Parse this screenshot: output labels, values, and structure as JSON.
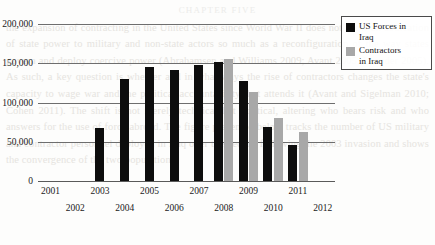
{
  "background_text": {
    "header": "CHAPTER FIVE",
    "paragraphs": [
      "the expansion of contracting in the United States since World War II",
      "does not show an abdication of state power to military and non-state",
      "actors so much as a reconfiguration of the way states govern and",
      "deploy coercive power (Abrahamsen and Williams 2009; Avant 2005;",
      "Leander 2005). As such, a key question is whether and in what ways",
      "the rise of contractors changes the state's capacity to wage war and",
      "the political accountability that attends it (Avant and Sigelman 2010;",
      "Cohen 2011). The shift is not merely technical but political, altering",
      "who bears risk and who answers for the use of force abroad.",
      "The figure presented below tracks the number of US military and",
      "contractor personnel deployed in Iraq over the decade following the",
      "2003 invasion and shows the convergence of the two populations."
    ]
  },
  "chart_data": {
    "type": "bar",
    "title": "",
    "xlabel": "",
    "ylabel": "",
    "ylim": [
      0,
      200000
    ],
    "ytick_labels": [
      "0",
      "50,000",
      "100,000",
      "150,000",
      "200,000"
    ],
    "ytick_values": [
      0,
      50000,
      100000,
      150000,
      200000
    ],
    "grid": true,
    "legend_position": "top-right",
    "categories": [
      "2001",
      "2002",
      "2003",
      "2004",
      "2005",
      "2006",
      "2007",
      "2008",
      "2009",
      "2010",
      "2011",
      "2012"
    ],
    "series": [
      {
        "name": "US Forces in Iraq",
        "color": "#0d0d0d",
        "values": [
          0,
          0,
          67000,
          130000,
          145000,
          141000,
          148000,
          152000,
          128000,
          69000,
          46000,
          0
        ]
      },
      {
        "name": "Contractors in Iraq",
        "color": "#a8a8a8",
        "values": [
          0,
          0,
          0,
          0,
          0,
          0,
          0,
          156000,
          114000,
          80000,
          62000,
          0
        ]
      }
    ]
  },
  "legend": {
    "items": [
      {
        "label_line1": "US Forces in",
        "label_line2": "Iraq",
        "color": "#0d0d0d"
      },
      {
        "label_line1": "Contractors",
        "label_line2": "in Iraq",
        "color": "#a8a8a8"
      }
    ]
  }
}
